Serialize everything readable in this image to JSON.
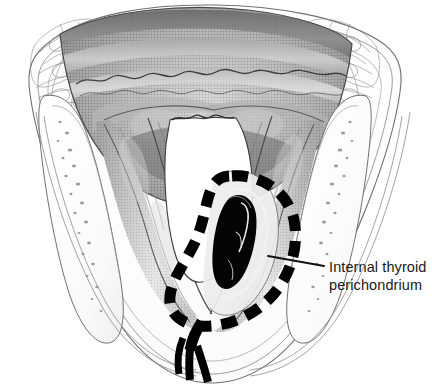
{
  "figure": {
    "kind": "anatomical-illustration",
    "view": "superior axial view of the larynx",
    "background_color": "#ffffff",
    "ink_color": "#111111",
    "annotation_color": "#000000",
    "style": "grayscale halftone line drawing"
  },
  "annotations": {
    "internal_thyroid_perichondrium": {
      "line1": "Internal thyroid",
      "line2": "perichondrium",
      "full_text": "Internal thyroid perichondrium",
      "leader_from_x": 268,
      "leader_from_y": 256,
      "leader_to_x": 324,
      "leader_to_y": 266
    }
  },
  "marker": {
    "name": "dashed-perichondrium-outline",
    "description": "thick black dashed teardrop outline encircling the right paraglottic space",
    "color": "#000000",
    "dash_on": 15,
    "dash_off": 10,
    "stroke_width": 11
  },
  "lesion": {
    "name": "tumor-mass",
    "description": "elongated solid black mass within the outlined region",
    "color": "#050505"
  },
  "structures": [
    {
      "name": "tongue-base",
      "tone": "#8f8f8f"
    },
    {
      "name": "epiglottis",
      "tone": "#7a7a7a"
    },
    {
      "name": "vallecula",
      "tone": "#6e6e6e"
    },
    {
      "name": "airway-glottic-lumen",
      "tone": "#ffffff"
    },
    {
      "name": "aryepiglottic-fold-left",
      "tone": "#9b9b9b"
    },
    {
      "name": "aryepiglottic-fold-right",
      "tone": "#9b9b9b"
    },
    {
      "name": "thyroid-lamina-left",
      "tone": "#fdfdfd"
    },
    {
      "name": "thyroid-lamina-right",
      "tone": "#fdfdfd"
    },
    {
      "name": "strap-muscle-left",
      "tone": "#f4f4f4"
    },
    {
      "name": "strap-muscle-right",
      "tone": "#f4f4f4"
    },
    {
      "name": "paraglottic-fat-stipple",
      "tone": "#b9b9b9"
    }
  ]
}
